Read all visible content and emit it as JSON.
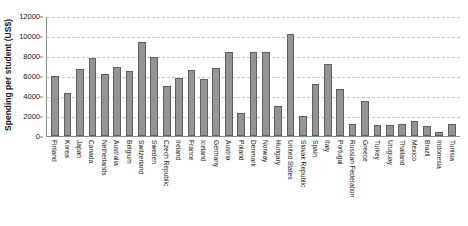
{
  "chart_data": {
    "type": "bar",
    "title": "",
    "xlabel": "",
    "ylabel": "Spending per student (US$)",
    "ylim": [
      0,
      12000
    ],
    "yticks": [
      0,
      2000,
      4000,
      6000,
      8000,
      10000,
      12000
    ],
    "grid": true,
    "legend": false,
    "bar_color": "#949494",
    "bar_edge_color": "#5e5e5e",
    "gridline_color": "#c9c9c9",
    "axis_color": "#8a8a8a",
    "categories": [
      "Finland",
      "Korea",
      "Japan",
      "Canada",
      "Netherlands",
      "Australia",
      "Belgium",
      "Switzerland",
      "Sweden",
      "Czech Republic",
      "Ireland",
      "France",
      "Iceland",
      "Germany",
      "Austria",
      "Poland",
      "Denmark",
      "Norway",
      "Hungary",
      "United States",
      "Slovak Republic",
      "Spain",
      "Italy",
      "Portugal",
      "Russian Federation",
      "Greece",
      "Turkey",
      "Uruguay",
      "Thailand",
      "Mexico",
      "Brazil",
      "Indonesia",
      "Tunisia"
    ],
    "values": [
      6000,
      4300,
      6700,
      7800,
      6200,
      6900,
      6500,
      9400,
      7900,
      5000,
      5800,
      6600,
      5700,
      6800,
      8400,
      2300,
      8400,
      8400,
      3000,
      10200,
      2000,
      5200,
      7200,
      4700,
      1200,
      3500,
      1100,
      1100,
      1200,
      1500,
      1000,
      400,
      1200
    ]
  }
}
